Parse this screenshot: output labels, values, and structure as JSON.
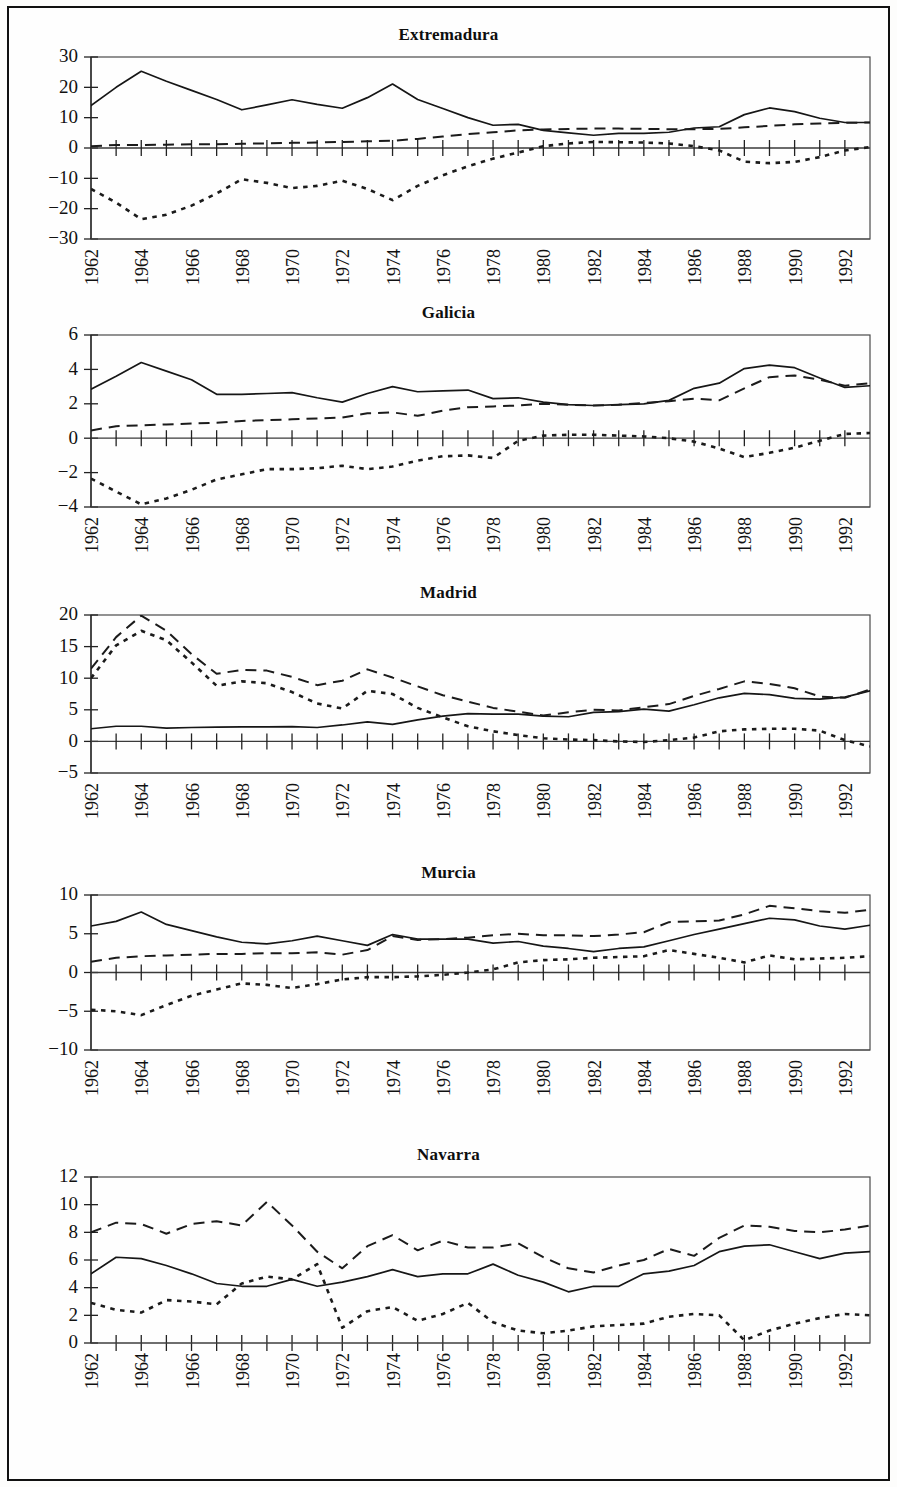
{
  "figure": {
    "panel_count": 5,
    "x_start_year": 1962,
    "x_end_year": 1993,
    "x_tick_step": 2
  },
  "chart_data": [
    {
      "type": "line",
      "title": "Extremadura",
      "xlabel": "",
      "ylabel": "",
      "xlim": [
        1962,
        1993
      ],
      "ylim": [
        -30,
        30
      ],
      "yticks": [
        -30,
        -20,
        -10,
        0,
        10,
        20,
        30
      ],
      "xticks": [
        1962,
        1964,
        1966,
        1968,
        1970,
        1972,
        1974,
        1976,
        1978,
        1980,
        1982,
        1984,
        1986,
        1988,
        1990,
        1992
      ],
      "grid": false,
      "legend": "none",
      "x": [
        1962,
        1963,
        1964,
        1965,
        1966,
        1967,
        1968,
        1969,
        1970,
        1971,
        1972,
        1973,
        1974,
        1975,
        1976,
        1977,
        1978,
        1979,
        1980,
        1981,
        1982,
        1983,
        1984,
        1985,
        1986,
        1987,
        1988,
        1989,
        1990,
        1991,
        1992,
        1993
      ],
      "series": [
        {
          "name": "solid",
          "style": "solid",
          "values": [
            14.0,
            20.0,
            25.3,
            22.0,
            19.0,
            16.0,
            12.6,
            14.2,
            15.9,
            14.4,
            13.1,
            16.6,
            21.1,
            16.0,
            13.0,
            10.0,
            7.5,
            7.8,
            5.8,
            5.0,
            4.2,
            4.8,
            4.8,
            5.2,
            6.6,
            7.0,
            11.0,
            13.2,
            12.0,
            9.8,
            8.4,
            8.4
          ]
        },
        {
          "name": "dashed",
          "style": "dashed",
          "values": [
            0.6,
            1.0,
            1.0,
            1.1,
            1.2,
            1.2,
            1.4,
            1.5,
            1.7,
            1.8,
            2.0,
            2.2,
            2.4,
            3.0,
            3.8,
            4.6,
            5.2,
            5.8,
            6.1,
            6.3,
            6.4,
            6.4,
            6.3,
            6.2,
            6.2,
            6.3,
            6.8,
            7.3,
            7.8,
            8.1,
            8.3,
            8.4
          ]
        },
        {
          "name": "dotted",
          "style": "dotted",
          "values": [
            -13.5,
            -18.0,
            -23.5,
            -22.0,
            -19.0,
            -15.0,
            -10.3,
            -11.5,
            -13.2,
            -12.5,
            -10.8,
            -13.5,
            -17.2,
            -12.5,
            -9.0,
            -6.0,
            -3.5,
            -1.5,
            0.6,
            1.5,
            2.0,
            1.9,
            1.8,
            1.5,
            0.6,
            -0.8,
            -4.5,
            -5.0,
            -4.6,
            -3.0,
            -0.8,
            0.3
          ]
        }
      ]
    },
    {
      "type": "line",
      "title": "Galicia",
      "xlabel": "",
      "ylabel": "",
      "xlim": [
        1962,
        1993
      ],
      "ylim": [
        -4,
        6
      ],
      "yticks": [
        -4,
        -2,
        0,
        2,
        4,
        6
      ],
      "xticks": [
        1962,
        1964,
        1966,
        1968,
        1970,
        1972,
        1974,
        1976,
        1978,
        1980,
        1982,
        1984,
        1986,
        1988,
        1990,
        1992
      ],
      "grid": false,
      "legend": "none",
      "x": [
        1962,
        1963,
        1964,
        1965,
        1966,
        1967,
        1968,
        1969,
        1970,
        1971,
        1972,
        1973,
        1974,
        1975,
        1976,
        1977,
        1978,
        1979,
        1980,
        1981,
        1982,
        1983,
        1984,
        1985,
        1986,
        1987,
        1988,
        1989,
        1990,
        1991,
        1992,
        1993
      ],
      "series": [
        {
          "name": "solid",
          "style": "solid",
          "values": [
            2.85,
            3.6,
            4.4,
            3.9,
            3.4,
            2.55,
            2.55,
            2.6,
            2.65,
            2.35,
            2.1,
            2.6,
            3.0,
            2.7,
            2.75,
            2.8,
            2.3,
            2.35,
            2.1,
            1.95,
            1.9,
            1.95,
            2.0,
            2.2,
            2.9,
            3.2,
            4.05,
            4.25,
            4.1,
            3.5,
            2.95,
            3.05
          ]
        },
        {
          "name": "dashed",
          "style": "dashed",
          "values": [
            0.45,
            0.7,
            0.75,
            0.8,
            0.85,
            0.9,
            1.0,
            1.05,
            1.1,
            1.15,
            1.2,
            1.45,
            1.5,
            1.3,
            1.6,
            1.8,
            1.85,
            1.9,
            2.0,
            1.95,
            1.9,
            1.95,
            2.05,
            2.15,
            2.3,
            2.2,
            2.9,
            3.55,
            3.65,
            3.4,
            3.05,
            3.2
          ]
        },
        {
          "name": "dotted",
          "style": "dotted",
          "values": [
            -2.35,
            -3.1,
            -3.85,
            -3.5,
            -3.0,
            -2.4,
            -2.1,
            -1.8,
            -1.8,
            -1.75,
            -1.6,
            -1.8,
            -1.65,
            -1.3,
            -1.05,
            -1.0,
            -1.15,
            -0.15,
            0.15,
            0.2,
            0.2,
            0.15,
            0.1,
            0.0,
            -0.2,
            -0.6,
            -1.1,
            -0.85,
            -0.55,
            -0.15,
            0.25,
            0.3
          ]
        }
      ]
    },
    {
      "type": "line",
      "title": "Madrid",
      "xlabel": "",
      "ylabel": "",
      "xlim": [
        1962,
        1993
      ],
      "ylim": [
        -5,
        20
      ],
      "yticks": [
        -5,
        0,
        5,
        10,
        15,
        20
      ],
      "xticks": [
        1962,
        1964,
        1966,
        1968,
        1970,
        1972,
        1974,
        1976,
        1978,
        1980,
        1982,
        1984,
        1986,
        1988,
        1990,
        1992
      ],
      "grid": false,
      "legend": "none",
      "x": [
        1962,
        1963,
        1964,
        1965,
        1966,
        1967,
        1968,
        1969,
        1970,
        1971,
        1972,
        1973,
        1974,
        1975,
        1976,
        1977,
        1978,
        1979,
        1980,
        1981,
        1982,
        1983,
        1984,
        1985,
        1986,
        1987,
        1988,
        1989,
        1990,
        1991,
        1992,
        1993
      ],
      "series": [
        {
          "name": "solid",
          "style": "solid",
          "values": [
            2.0,
            2.4,
            2.4,
            2.1,
            2.2,
            2.25,
            2.3,
            2.3,
            2.35,
            2.2,
            2.6,
            3.1,
            2.7,
            3.4,
            4.0,
            4.4,
            4.3,
            4.3,
            4.0,
            3.9,
            4.6,
            4.7,
            5.1,
            4.8,
            5.8,
            6.9,
            7.6,
            7.4,
            6.8,
            6.7,
            7.0,
            8.0
          ]
        },
        {
          "name": "dashed",
          "style": "dashed",
          "values": [
            11.5,
            16.5,
            19.9,
            17.5,
            13.8,
            10.7,
            11.3,
            11.2,
            10.2,
            8.9,
            9.6,
            11.4,
            10.1,
            8.7,
            7.3,
            6.3,
            5.3,
            4.7,
            4.1,
            4.6,
            5.0,
            4.9,
            5.4,
            5.9,
            7.2,
            8.3,
            9.5,
            9.1,
            8.4,
            7.1,
            6.9,
            8.2
          ]
        },
        {
          "name": "dotted",
          "style": "dotted",
          "values": [
            10.0,
            15.2,
            17.5,
            16.0,
            12.5,
            8.8,
            9.5,
            9.2,
            7.8,
            6.0,
            5.2,
            8.0,
            7.5,
            5.3,
            3.8,
            2.4,
            1.6,
            1.0,
            0.5,
            0.3,
            0.2,
            0.0,
            -0.1,
            0.2,
            0.6,
            1.6,
            1.9,
            2.0,
            2.0,
            1.7,
            0.2,
            -0.8
          ]
        }
      ]
    },
    {
      "type": "line",
      "title": "Murcia",
      "xlabel": "",
      "ylabel": "",
      "xlim": [
        1962,
        1993
      ],
      "ylim": [
        -10,
        10
      ],
      "yticks": [
        -10,
        -5,
        0,
        5,
        10
      ],
      "xticks": [
        1962,
        1964,
        1966,
        1968,
        1970,
        1972,
        1974,
        1976,
        1978,
        1980,
        1982,
        1984,
        1986,
        1988,
        1990,
        1992
      ],
      "grid": false,
      "legend": "none",
      "x": [
        1962,
        1963,
        1964,
        1965,
        1966,
        1967,
        1968,
        1969,
        1970,
        1971,
        1972,
        1973,
        1974,
        1975,
        1976,
        1977,
        1978,
        1979,
        1980,
        1981,
        1982,
        1983,
        1984,
        1985,
        1986,
        1987,
        1988,
        1989,
        1990,
        1991,
        1992,
        1993
      ],
      "series": [
        {
          "name": "solid",
          "style": "solid",
          "values": [
            6.0,
            6.6,
            7.8,
            6.2,
            5.4,
            4.6,
            3.9,
            3.7,
            4.1,
            4.7,
            4.1,
            3.5,
            4.9,
            4.3,
            4.3,
            4.3,
            3.8,
            4.0,
            3.4,
            3.1,
            2.7,
            3.1,
            3.3,
            4.1,
            4.9,
            5.6,
            6.3,
            7.0,
            6.8,
            6.0,
            5.6,
            6.1
          ]
        },
        {
          "name": "dashed",
          "style": "dashed",
          "values": [
            1.4,
            1.9,
            2.1,
            2.2,
            2.3,
            2.4,
            2.4,
            2.5,
            2.5,
            2.6,
            2.3,
            2.9,
            4.7,
            4.2,
            4.3,
            4.5,
            4.8,
            5.0,
            4.8,
            4.8,
            4.7,
            4.9,
            5.2,
            6.5,
            6.6,
            6.7,
            7.5,
            8.6,
            8.3,
            7.9,
            7.7,
            8.1
          ]
        },
        {
          "name": "dotted",
          "style": "dotted",
          "values": [
            -4.8,
            -5.0,
            -5.5,
            -4.2,
            -3.0,
            -2.2,
            -1.4,
            -1.6,
            -2.0,
            -1.5,
            -0.9,
            -0.6,
            -0.6,
            -0.5,
            -0.3,
            0.0,
            0.4,
            1.3,
            1.6,
            1.7,
            1.9,
            2.0,
            2.1,
            2.9,
            2.4,
            1.9,
            1.3,
            2.2,
            1.7,
            1.8,
            1.9,
            2.1
          ]
        }
      ]
    },
    {
      "type": "line",
      "title": "Navarra",
      "xlabel": "",
      "ylabel": "",
      "xlim": [
        1962,
        1993
      ],
      "ylim": [
        0,
        12
      ],
      "yticks": [
        0,
        2,
        4,
        6,
        8,
        10,
        12
      ],
      "xticks": [
        1962,
        1964,
        1966,
        1968,
        1970,
        1972,
        1974,
        1976,
        1978,
        1980,
        1982,
        1984,
        1986,
        1988,
        1990,
        1992
      ],
      "grid": false,
      "legend": "none",
      "x": [
        1962,
        1963,
        1964,
        1965,
        1966,
        1967,
        1968,
        1969,
        1970,
        1971,
        1972,
        1973,
        1974,
        1975,
        1976,
        1977,
        1978,
        1979,
        1980,
        1981,
        1982,
        1983,
        1984,
        1985,
        1986,
        1987,
        1988,
        1989,
        1990,
        1991,
        1992,
        1993
      ],
      "series": [
        {
          "name": "solid",
          "style": "solid",
          "values": [
            5.0,
            6.2,
            6.1,
            5.6,
            5.0,
            4.3,
            4.1,
            4.1,
            4.6,
            4.1,
            4.4,
            4.8,
            5.3,
            4.8,
            5.0,
            5.0,
            5.7,
            4.9,
            4.4,
            3.7,
            4.1,
            4.1,
            5.0,
            5.2,
            5.6,
            6.6,
            7.0,
            7.1,
            6.6,
            6.1,
            6.5,
            6.6
          ]
        },
        {
          "name": "dashed",
          "style": "dashed",
          "values": [
            8.0,
            8.7,
            8.6,
            7.9,
            8.6,
            8.8,
            8.5,
            10.2,
            8.5,
            6.6,
            5.4,
            7.0,
            7.8,
            6.7,
            7.4,
            6.9,
            6.9,
            7.2,
            6.2,
            5.4,
            5.1,
            5.6,
            6.0,
            6.8,
            6.3,
            7.6,
            8.5,
            8.4,
            8.1,
            8.0,
            8.2,
            8.5
          ]
        },
        {
          "name": "dotted",
          "style": "dotted",
          "values": [
            2.9,
            2.4,
            2.2,
            3.1,
            3.0,
            2.8,
            4.3,
            4.8,
            4.6,
            5.7,
            1.1,
            2.3,
            2.6,
            1.6,
            2.1,
            2.9,
            1.5,
            0.9,
            0.7,
            0.9,
            1.2,
            1.3,
            1.4,
            1.9,
            2.1,
            2.0,
            0.2,
            0.9,
            1.4,
            1.8,
            2.1,
            2.0
          ]
        }
      ]
    }
  ]
}
